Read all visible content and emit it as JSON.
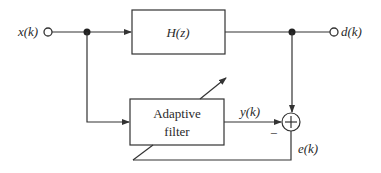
{
  "diagram": {
    "signals": {
      "input": "x(k)",
      "desired": "d(k)",
      "output": "y(k)",
      "error": "e(k)"
    },
    "blocks": {
      "plant": "H(z)",
      "adaptive_line1": "Adaptive",
      "adaptive_line2": "filter"
    },
    "summer": {
      "symbol": "+",
      "minus_sign": "−"
    },
    "colors": {
      "stroke": "#333333",
      "text": "#2a2a2a",
      "background": "#ffffff"
    }
  }
}
